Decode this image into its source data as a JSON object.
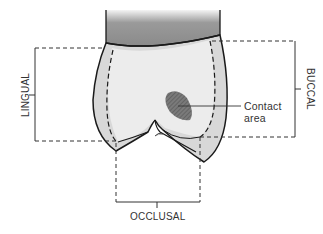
{
  "figure": {
    "labels": {
      "lingual": "LINGUAL",
      "buccal": "BUCCAL",
      "occlusal": "OCCLUSAL",
      "contact_line1": "Contact",
      "contact_line2": "area"
    },
    "colors": {
      "outline": "#1a1a1a",
      "crown_fill": "#e9e9e9",
      "enamel_band": "#d6d6d6",
      "root_dark": "#8a8a8a",
      "root_light": "#dcdcdc",
      "contact_fill": "#6a6a6a",
      "bracket": "#333333"
    }
  }
}
